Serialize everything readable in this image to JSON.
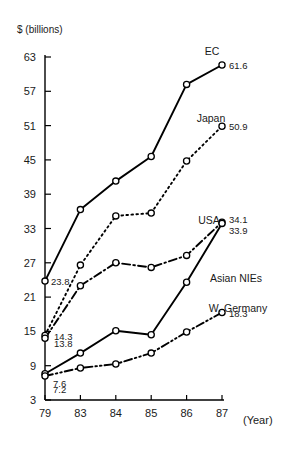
{
  "chart_data": {
    "type": "line",
    "title": "",
    "subtitle": "",
    "ylabel": "$ (billions)",
    "xlabel": "(Year)",
    "x": [
      "79",
      "83",
      "84",
      "85",
      "86",
      "87"
    ],
    "categories": [
      "79",
      "83",
      "84",
      "85",
      "86",
      "87"
    ],
    "ylim": [
      3,
      63
    ],
    "y_ticks": [
      3,
      9,
      15,
      21,
      27,
      33,
      39,
      45,
      51,
      57,
      63
    ],
    "grid": false,
    "legend": "inline-end-labels",
    "series": [
      {
        "name": "EC",
        "style": "solid",
        "marker": "open-circle",
        "values": [
          23.8,
          36.3,
          41.3,
          45.6,
          58.2,
          61.6
        ],
        "start_label": "23.8",
        "end_label": "61.6"
      },
      {
        "name": "Japan",
        "style": "dotted",
        "marker": "open-circle",
        "values": [
          14.3,
          26.6,
          35.2,
          35.7,
          44.8,
          50.9
        ],
        "start_label": "14.3",
        "end_label": "50.9"
      },
      {
        "name": "USA",
        "style": "dash-dot",
        "marker": "open-circle",
        "values": [
          13.8,
          23.0,
          27.0,
          26.2,
          28.3,
          34.1
        ],
        "start_label": "13.8",
        "end_label": "34.1"
      },
      {
        "name": "Asian NIEs",
        "style": "solid",
        "marker": "open-circle",
        "values": [
          7.6,
          11.2,
          15.1,
          14.4,
          23.6,
          33.9
        ],
        "start_label": "7.6",
        "end_label": "33.9"
      },
      {
        "name": "W. Germany",
        "style": "dash-dot-dot",
        "marker": "open-circle",
        "values": [
          7.2,
          8.6,
          9.3,
          11.2,
          14.9,
          18.3
        ],
        "start_label": "7.2",
        "end_label": "18.3"
      }
    ],
    "annotations": {
      "unit": "$ (billions)",
      "year_note": "(Year)"
    },
    "colors": {
      "line": "#000000",
      "marker_fill": "#ffffff",
      "text": "#1a1a1a",
      "background": "#ffffff"
    }
  }
}
